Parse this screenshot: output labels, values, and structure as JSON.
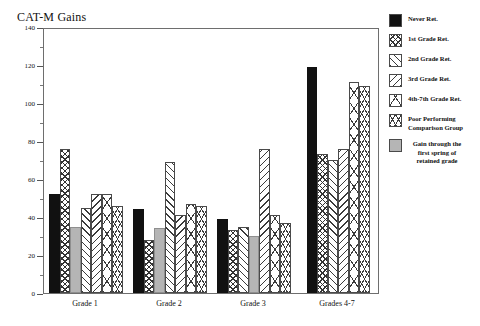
{
  "chart_data": {
    "type": "bar",
    "title": "CAT-M Gains",
    "xlabel": "",
    "ylabel": "",
    "ylim": [
      0,
      140
    ],
    "ytick_step": 20,
    "yminor_step": 10,
    "grid": false,
    "legend_position": "right",
    "ytick_labels": [
      "0",
      "20",
      "40",
      "60",
      "80",
      "100",
      "120",
      "140"
    ],
    "categories": [
      "Grade 1",
      "Grade 2",
      "Grade 3",
      "Grades 4-7"
    ],
    "series": [
      {
        "name": "Never Ret.",
        "pattern": "solid-black",
        "values": [
          52,
          44,
          39,
          119
        ]
      },
      {
        "name": "1st Grade Ret.",
        "pattern": "checkerboard",
        "values": [
          76,
          28,
          33,
          73
        ]
      },
      {
        "name": "2nd Grade Ret.",
        "pattern": "diagonal-right",
        "values": [
          45,
          69,
          35,
          70
        ]
      },
      {
        "name": "3rd Grade Ret.",
        "pattern": "diagonal-left",
        "values": [
          52,
          41,
          76,
          76
        ]
      },
      {
        "name": "4th-7th Grade Ret.",
        "pattern": "cross-hatch",
        "values": [
          52,
          47,
          41,
          111
        ]
      },
      {
        "name": "Poor Performing Comparison Group",
        "pattern": "herringbone",
        "values": [
          46,
          46,
          37,
          109
        ]
      },
      {
        "name": "Gain through the first spring of retained grade",
        "pattern": "solid-gray",
        "values": [
          35,
          34,
          30,
          0
        ]
      }
    ],
    "annotations": [
      "Gray bar shows the gain through the first spring of the retained grade, plotted against the retained cohort of each group."
    ]
  },
  "legend": {
    "items": [
      {
        "label": "Never Ret.",
        "swatch": "solid-black"
      },
      {
        "label": "1st Grade Ret.",
        "swatch": "checkerboard"
      },
      {
        "label": "2nd Grade Ret.",
        "swatch": "diagonal-right"
      },
      {
        "label": "3rd Grade Ret.",
        "swatch": "diagonal-left"
      },
      {
        "label": "4th-7th Grade Ret.",
        "swatch": "cross-hatch"
      },
      {
        "label": "Poor Performing\nComparison Group",
        "swatch": "herringbone"
      },
      {
        "label": "Gain through the\nfirst spring of\nretained grade",
        "swatch": "solid-gray"
      }
    ]
  }
}
